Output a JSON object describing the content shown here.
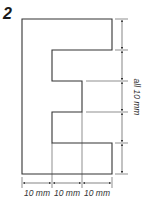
{
  "figure": {
    "number": "2",
    "shape": "E-shaped outline",
    "stroke_color": "#333333"
  },
  "dimensions": {
    "bottom": [
      {
        "label": "10 mm"
      },
      {
        "label": "10 mm"
      },
      {
        "label": "10 mm"
      }
    ],
    "right": {
      "label": "all 10 mm",
      "segments": 5
    }
  }
}
